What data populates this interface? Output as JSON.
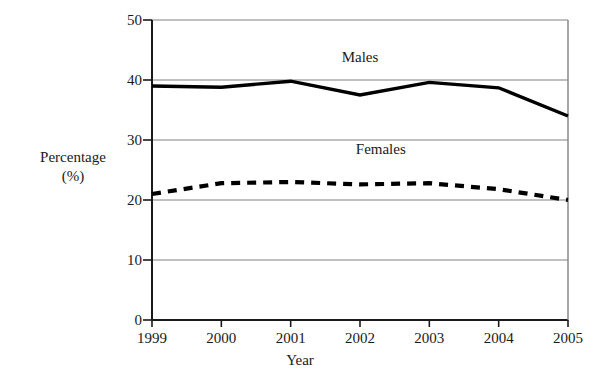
{
  "chart_data": {
    "type": "line",
    "title": "",
    "xlabel": "Year",
    "ylabel_line1": "Percentage",
    "ylabel_line2": "(%)",
    "categories": [
      "1999",
      "2000",
      "2001",
      "2002",
      "2003",
      "2004",
      "2005"
    ],
    "x": [
      1999,
      2000,
      2001,
      2002,
      2003,
      2004,
      2005
    ],
    "xlim": [
      1999,
      2005
    ],
    "ylim": [
      0,
      50
    ],
    "yticks": [
      "0",
      "10",
      "20",
      "30",
      "40",
      "50"
    ],
    "ytick_values": [
      0,
      10,
      20,
      30,
      40,
      50
    ],
    "grid": "horizontal",
    "legend_position": "inline-annotations",
    "series": [
      {
        "name": "Males",
        "style": "solid",
        "color": "#000000",
        "values": [
          39.0,
          38.8,
          39.8,
          37.5,
          39.6,
          38.7,
          34.0
        ]
      },
      {
        "name": "Females",
        "style": "dashed",
        "color": "#000000",
        "values": [
          21.0,
          22.8,
          23.0,
          22.6,
          22.8,
          21.8,
          20.0
        ]
      }
    ],
    "annotations": [
      {
        "text": "Males",
        "x": 2002.0,
        "y": 43.5
      },
      {
        "text": "Females",
        "x": 2002.3,
        "y": 28.2
      }
    ]
  },
  "plot": {
    "axis_color": "#1a1a1a",
    "grid_color": "#808080",
    "background": "#ffffff"
  }
}
